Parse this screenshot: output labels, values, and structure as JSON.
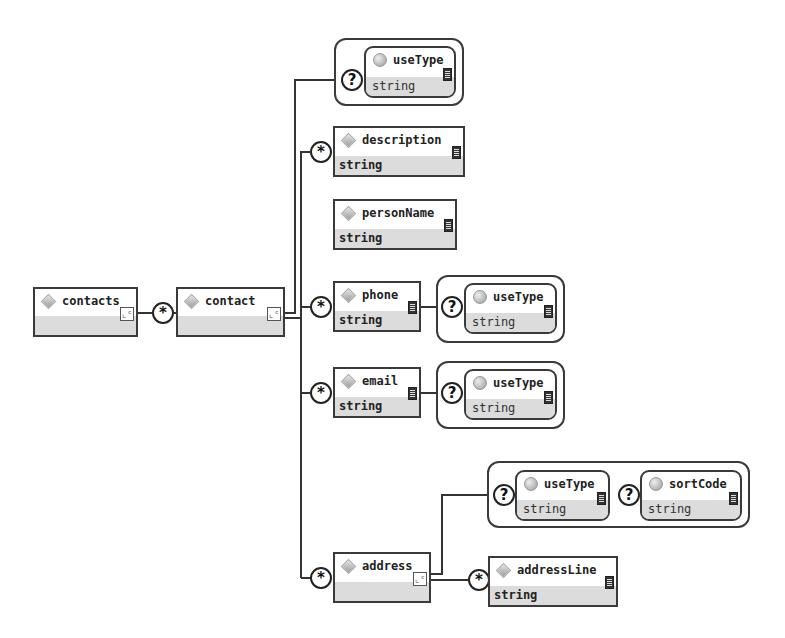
{
  "diagram": {
    "type": "XML Schema element tree",
    "root": {
      "name": "contacts",
      "child_occurrence": "*"
    },
    "contact": {
      "name": "contact"
    },
    "contact_attributes": [
      {
        "occurrence": "?",
        "name": "useType",
        "type": "string"
      }
    ],
    "description": {
      "occurrence": "*",
      "name": "description",
      "type": "string"
    },
    "personName": {
      "name": "personName",
      "type": "string"
    },
    "phone": {
      "occurrence": "*",
      "name": "phone",
      "type": "string",
      "attr": {
        "occurrence": "?",
        "name": "useType",
        "type": "string"
      }
    },
    "email": {
      "occurrence": "*",
      "name": "email",
      "type": "string",
      "attr": {
        "occurrence": "?",
        "name": "useType",
        "type": "string"
      }
    },
    "address": {
      "occurrence": "*",
      "name": "address",
      "attrs": [
        {
          "occurrence": "?",
          "name": "useType",
          "type": "string"
        },
        {
          "occurrence": "?",
          "name": "sortCode",
          "type": "string"
        }
      ],
      "child": {
        "occurrence": "*",
        "name": "addressLine",
        "type": "string"
      }
    }
  },
  "icons": {
    "element": "diamond-icon",
    "attribute": "circle-icon",
    "complex": "complex-type-icon",
    "documentation": "doc-icon"
  },
  "glyphs": {
    "complex": "⌞ᶜ",
    "star": "*",
    "question": "?"
  }
}
